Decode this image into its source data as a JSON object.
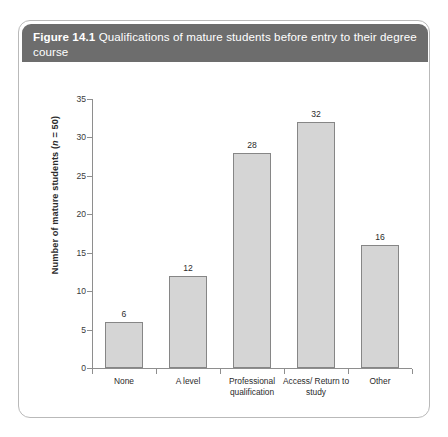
{
  "figure": {
    "number": "Figure 14.1",
    "caption": " Qualifications of mature students before entry to their degree course"
  },
  "colors": {
    "header_bg": "#6d6d6d",
    "header_text": "#ffffff",
    "card_border": "#b9b9b9",
    "bar_fill": "#d5d5d5",
    "bar_stroke": "#868686",
    "axis_line": "#8e8e8e"
  },
  "chart_data": {
    "type": "bar",
    "title": "Figure 14.1 Qualifications of mature students before entry to their degree course",
    "categories": [
      "None",
      "A level",
      "Professional qualification",
      "Access/ Return to study",
      "Other"
    ],
    "values": [
      6,
      12,
      28,
      32,
      16
    ],
    "data_labels": [
      "6",
      "12",
      "28",
      "32",
      "16"
    ],
    "xlabel": "Qualifications",
    "ylabel": "Number of mature students (n = 50)",
    "ylim": [
      0,
      35
    ],
    "yticks": [
      0,
      5,
      10,
      15,
      20,
      25,
      30,
      35
    ],
    "ytick_labels": [
      "0",
      "5",
      "10",
      "15",
      "20",
      "25",
      "30",
      "35"
    ],
    "grid": false,
    "legend": false,
    "sample_size": 50
  }
}
